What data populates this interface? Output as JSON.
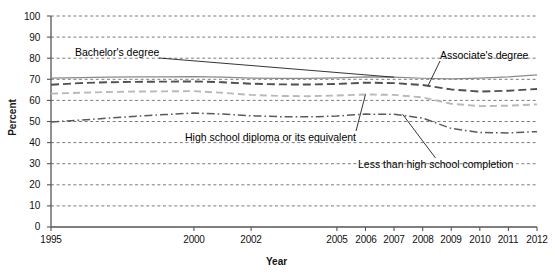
{
  "chart_data": {
    "type": "line",
    "title": "",
    "xlabel": "Year",
    "ylabel": "Percent",
    "xlim": [
      1995,
      2012
    ],
    "ylim": [
      0,
      100
    ],
    "grid": true,
    "legend_position": "inline-annotations",
    "x_tick_labels": [
      "1995",
      "2000",
      "2002",
      "2005",
      "2006",
      "2007",
      "2008",
      "2009",
      "2010",
      "2011",
      "2012"
    ],
    "x_tick_values": [
      1995,
      2000,
      2002,
      2005,
      2006,
      2007,
      2008,
      2009,
      2010,
      2011,
      2012
    ],
    "y_tick_labels": [
      "0",
      "10",
      "20",
      "30",
      "40",
      "50",
      "60",
      "70",
      "80",
      "90",
      "100"
    ],
    "y_tick_values": [
      0,
      10,
      20,
      30,
      40,
      50,
      60,
      70,
      80,
      90,
      100
    ],
    "x": [
      1995,
      1996,
      1997,
      1998,
      1999,
      2000,
      2001,
      2002,
      2003,
      2004,
      2005,
      2006,
      2007,
      2008,
      2009,
      2010,
      2011,
      2012
    ],
    "series": [
      {
        "name": "Bachelor's degree",
        "style": "solid",
        "color": "#8a8a8a",
        "values": [
          70.6,
          70.8,
          71.0,
          71.1,
          71.2,
          71.3,
          71.0,
          70.6,
          70.4,
          70.4,
          70.7,
          71.2,
          71.0,
          70.5,
          70.2,
          70.6,
          71.2,
          72.1
        ]
      },
      {
        "name": "Associate's degree",
        "style": "dashed",
        "color": "#4f4f4f",
        "values": [
          67.4,
          68.2,
          68.6,
          68.8,
          68.9,
          69.0,
          68.6,
          67.9,
          67.6,
          67.5,
          67.8,
          68.4,
          68.2,
          67.3,
          65.2,
          64.2,
          64.6,
          65.4
        ]
      },
      {
        "name": "High school diploma or its equivalent",
        "style": "dashed-light",
        "color": "#b9b9b9",
        "values": [
          63.2,
          63.6,
          64.0,
          64.2,
          64.3,
          64.4,
          63.6,
          62.6,
          62.1,
          62.0,
          62.3,
          62.8,
          62.6,
          61.4,
          58.4,
          57.3,
          57.5,
          58.1
        ]
      },
      {
        "name": "Less than high school completion",
        "style": "dash-dot",
        "color": "#5a5a5a",
        "values": [
          49.8,
          50.6,
          51.6,
          52.5,
          53.3,
          54.0,
          53.5,
          52.7,
          52.3,
          52.2,
          52.6,
          53.5,
          53.4,
          51.6,
          46.7,
          44.8,
          44.6,
          45.2
        ]
      }
    ],
    "annotations": [
      {
        "label": "Bachelor's degree",
        "text_x": 75,
        "text_y": 46
      },
      {
        "label": "Associate's degree",
        "text_x": 440,
        "text_y": 49
      },
      {
        "label": "High school diploma or its equivalent",
        "text_x": 185,
        "text_y": 131
      },
      {
        "label": "Less than high school completion",
        "text_x": 358,
        "text_y": 158
      }
    ]
  }
}
